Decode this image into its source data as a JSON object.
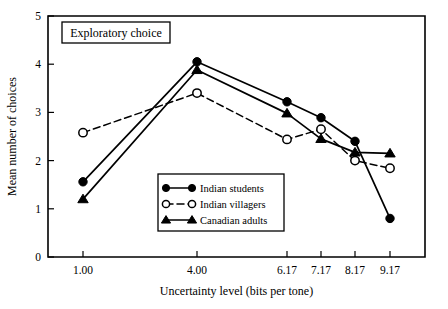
{
  "figure": {
    "panel_label": "Exploratory choice"
  },
  "chart_data": {
    "type": "line",
    "title": "Exploratory choice",
    "xlabel": "Uncertainty level (bits per tone)",
    "ylabel": "Mean number of choices",
    "categories": [
      "1.00",
      "4.00",
      "6.17",
      "7.17",
      "8.17",
      "9.17"
    ],
    "x_positions": [
      83,
      197,
      287,
      321,
      355,
      390
    ],
    "ylim": [
      0,
      5
    ],
    "yticks": [
      0,
      1,
      2,
      3,
      4,
      5
    ],
    "ytick_labels": [
      "0",
      "1",
      "2",
      "3",
      "4",
      "5"
    ],
    "grid": false,
    "legend_position": "inside-bottom-center",
    "series": [
      {
        "name": "Indian students",
        "marker": "filled-circle",
        "line": "solid",
        "values": [
          1.56,
          4.05,
          3.22,
          2.89,
          2.4,
          0.8
        ]
      },
      {
        "name": "Indian villagers",
        "marker": "open-circle",
        "line": "dashed",
        "values": [
          2.58,
          3.4,
          2.44,
          2.65,
          2.0,
          1.84
        ]
      },
      {
        "name": "Canadian adults",
        "marker": "filled-triangle",
        "line": "solid",
        "values": [
          1.2,
          3.88,
          2.98,
          2.45,
          2.17,
          2.15
        ]
      }
    ]
  }
}
